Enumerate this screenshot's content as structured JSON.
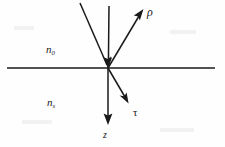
{
  "figure": {
    "name": "reflection-refraction-at-interface",
    "background_color": "#fefefe",
    "ink_color": "#1a1a1a",
    "width": 225,
    "height": 147
  },
  "labels": {
    "medium_upper": {
      "symbol": "n",
      "subscript": "0",
      "full": "n0"
    },
    "medium_lower": {
      "symbol": "n",
      "subscript": "s",
      "full": "ns"
    },
    "reflected_ray": "ρ",
    "transmitted_ray": "τ",
    "axis_z": "z"
  },
  "geometry": {
    "interface_line": {
      "x1": 7,
      "y1": 68,
      "x2": 215,
      "y2": 68
    },
    "origin": {
      "x": 108,
      "y": 68
    },
    "incident_oblique_ray": {
      "x1": 80,
      "y1": 3,
      "x2": 108,
      "y2": 68
    },
    "incident_vertical_ray": {
      "x1": 109,
      "y1": 6,
      "x2": 108,
      "y2": 68
    },
    "reflected_ray": {
      "x1": 108,
      "y1": 68,
      "x2": 143,
      "y2": 10
    },
    "transmitted_ray": {
      "x1": 108,
      "y1": 68,
      "x2": 128,
      "y2": 103
    },
    "z_axis_ray": {
      "x1": 108,
      "y1": 68,
      "x2": 108,
      "y2": 124
    }
  }
}
